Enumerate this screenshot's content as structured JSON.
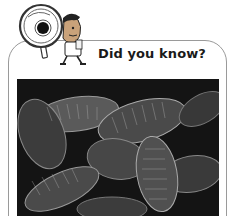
{
  "card": {
    "title": "Did you know?",
    "mascot": "explorer-with-magnifying-glass",
    "photo": {
      "subject": "cluster of woodlice (isopods)",
      "tone": "black-and-white"
    }
  },
  "colors": {
    "border": "#9a9a9a",
    "text": "#1a1a1a",
    "photo_dark": "#141414"
  }
}
